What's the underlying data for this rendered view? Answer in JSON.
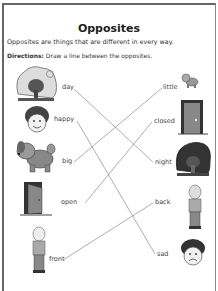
{
  "worksheet": {
    "title": "Opposites",
    "intro": "Opposites are things that are different in every way.",
    "directions_label": "Directions:",
    "directions_text": " Draw a line between the opposites."
  },
  "left_column": [
    {
      "word": "day",
      "picture": "tree-in-daylight-with-sun"
    },
    {
      "word": "happy",
      "picture": "smiling-boy-face"
    },
    {
      "word": "big",
      "picture": "big-dog"
    },
    {
      "word": "open",
      "picture": "open-door"
    },
    {
      "word": "front",
      "picture": "person-front-view"
    }
  ],
  "right_column": [
    {
      "word": "little",
      "picture": "small-dog"
    },
    {
      "word": "closed",
      "picture": "closed-door"
    },
    {
      "word": "night",
      "picture": "tree-at-night-with-moon"
    },
    {
      "word": "back",
      "picture": "person-back-view"
    },
    {
      "word": "sad",
      "picture": "sad-boy-face"
    }
  ],
  "matches": [
    {
      "from": "day",
      "to": "night"
    },
    {
      "from": "happy",
      "to": "sad"
    },
    {
      "from": "big",
      "to": "little"
    },
    {
      "from": "open",
      "to": "closed"
    },
    {
      "from": "front",
      "to": "back"
    }
  ]
}
